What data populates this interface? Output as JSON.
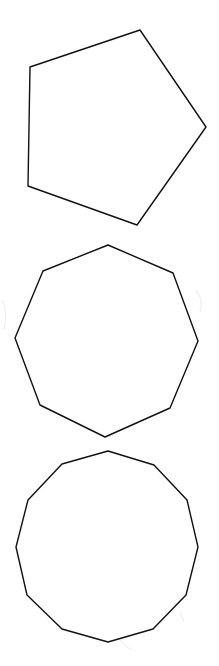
{
  "diagram": {
    "background": "#ffffff",
    "stroke_color": "#111111",
    "shapes": [
      {
        "name": "pentagon",
        "sides": 5,
        "points": "140,30 206,127 137,225 28,186 30,67"
      },
      {
        "name": "octagon",
        "sides": 8,
        "points": "108,245 173,273 198,341 170,408 105,437 40,405 15,338 43,271"
      },
      {
        "name": "dodecagon",
        "sides": 12,
        "points": "108,451 154,465 187,500 198,547 186,595 153,629 108,642 62,629 27,595 16,547 28,500 62,464"
      }
    ]
  }
}
